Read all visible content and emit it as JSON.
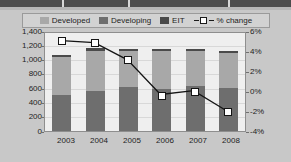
{
  "figure": {
    "background_color": "#c8c8c8",
    "plot_background_color": "#efefef"
  },
  "legend": {
    "position": "top-center",
    "items": [
      {
        "label": "Developed",
        "swatch_color": "#a8a8a8",
        "marker": "square-swatch"
      },
      {
        "label": "Developing",
        "swatch_color": "#6e6e6e",
        "marker": "square-swatch"
      },
      {
        "label": "EIT",
        "swatch_color": "#4a4a4a",
        "marker": "square-swatch"
      },
      {
        "label": "% change",
        "swatch_color": "#ffffff",
        "marker": "line-with-open-square"
      }
    ]
  },
  "chart_data": {
    "type": "bar",
    "subtype": "stacked-bar-with-line-overlay",
    "title": "",
    "xlabel": "",
    "ylabel": "",
    "y2label": "",
    "grid": true,
    "categories": [
      "2003",
      "2004",
      "2005",
      "2006",
      "2007",
      "2008"
    ],
    "yticks": [
      "0",
      "200",
      "400",
      "600",
      "800",
      "1,000",
      "1,200",
      "1,400"
    ],
    "ylim": [
      0,
      1400
    ],
    "y2ticks": [
      "-4%",
      "-2%",
      "0%",
      "2%",
      "4%",
      "6%"
    ],
    "y2lim": [
      -4,
      6
    ],
    "series": [
      {
        "name": "Developing",
        "axis": "left",
        "color": "#6e6e6e",
        "stack": 1,
        "values": [
          520,
          575,
          625,
          600,
          640,
          620
        ]
      },
      {
        "name": "Developed",
        "axis": "left",
        "color": "#a8a8a8",
        "stack": 2,
        "values": [
          540,
          565,
          520,
          540,
          500,
          495
        ]
      },
      {
        "name": "EIT",
        "axis": "left",
        "color": "#4a4a4a",
        "stack": 3,
        "values": [
          25,
          40,
          30,
          35,
          35,
          35
        ]
      }
    ],
    "totals": [
      1085,
      1180,
      1175,
      1175,
      1175,
      1150
    ],
    "line_series": {
      "name": "% change",
      "axis": "right",
      "color": "#141414",
      "marker": "open-square",
      "marker_fill": "#ffffff",
      "values": [
        5.2,
        5.0,
        3.2,
        -0.4,
        0.0,
        -2.1
      ]
    }
  }
}
